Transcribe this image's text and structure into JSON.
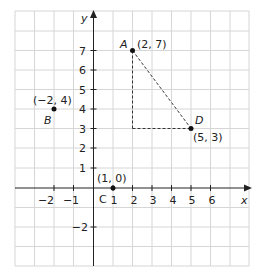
{
  "diagram": {
    "type": "coordinate-grid",
    "axes": {
      "x_label": "x",
      "y_label": "y"
    },
    "x_ticks": [
      {
        "v": -2,
        "label": "−2"
      },
      {
        "v": -1,
        "label": "−1"
      },
      {
        "v": 1,
        "label": "1"
      },
      {
        "v": 2,
        "label": "2"
      },
      {
        "v": 3,
        "label": "3"
      },
      {
        "v": 4,
        "label": "4"
      },
      {
        "v": 5,
        "label": "5"
      },
      {
        "v": 6,
        "label": "6"
      }
    ],
    "y_ticks": [
      {
        "v": 7,
        "label": "7"
      },
      {
        "v": 6,
        "label": "6"
      },
      {
        "v": 5,
        "label": "5"
      },
      {
        "v": 4,
        "label": "4"
      },
      {
        "v": 3,
        "label": "3"
      },
      {
        "v": 2,
        "label": "2"
      },
      {
        "v": 1,
        "label": "1"
      },
      {
        "v": -2,
        "label": "−2"
      }
    ],
    "points": [
      {
        "name": "A",
        "coords": "(2, 7)",
        "x": 2,
        "y": 7
      },
      {
        "name": "B",
        "coords": "(−2, 4)",
        "x": -2,
        "y": 4
      },
      {
        "name": "C",
        "coords": "(1, 0)",
        "x": 1,
        "y": 0
      },
      {
        "name": "D",
        "coords": "(5, 3)",
        "x": 5,
        "y": 3
      }
    ],
    "dashed_lines": [
      {
        "from": "(2, 7)",
        "to": "(5, 3)"
      },
      {
        "from": "(2, 7)",
        "to": "(2, 3)"
      },
      {
        "from": "(2, 3)",
        "to": "(5, 3)"
      }
    ],
    "colors": {
      "grid": "#d4d4d4",
      "axis": "#222222",
      "point": "#111111"
    }
  }
}
